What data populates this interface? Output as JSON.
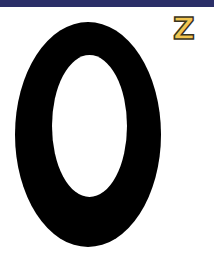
{
  "header": {
    "band_color": "#2b2f68"
  },
  "main": {
    "digit": "0",
    "digit_color": "#000000",
    "superscript": "Z",
    "superscript_color": "#f2c650",
    "superscript_outline": "#3a3320"
  }
}
